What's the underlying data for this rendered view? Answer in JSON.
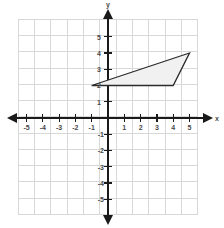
{
  "figure": {
    "kind": "coordinate-plane",
    "background_color": "#ffffff",
    "grid_color": "#d8d8d8",
    "axis_color": "#1a1a1a",
    "label_color": "#4a4a4a"
  },
  "axes": {
    "x_axis_label": "x",
    "y_axis_label": "y",
    "x_tick_labels": [
      "-5",
      "-4",
      "-3",
      "-2",
      "-1",
      "1",
      "2",
      "3",
      "4",
      "5"
    ],
    "y_tick_labels": [
      "5",
      "4",
      "3",
      "2",
      "1",
      "-1",
      "-2",
      "-3",
      "-4",
      "-5"
    ]
  },
  "chart_data": {
    "type": "scatter",
    "title": "",
    "xlabel": "x",
    "ylabel": "y",
    "xlim": [
      -6,
      6
    ],
    "ylim": [
      -6,
      6
    ],
    "xticks": [
      -5,
      -4,
      -3,
      -2,
      -1,
      1,
      2,
      3,
      4,
      5
    ],
    "yticks": [
      5,
      4,
      3,
      2,
      1,
      -1,
      -2,
      -3,
      -4,
      -5
    ],
    "grid": true,
    "grid_spacing": 1,
    "legend": false,
    "shapes": [
      {
        "name": "triangle",
        "type": "polygon",
        "vertices": [
          [
            -1,
            2
          ],
          [
            5,
            4
          ],
          [
            4,
            2
          ]
        ],
        "fill": "#f1f1f1",
        "stroke": "#2b2b2b"
      }
    ]
  }
}
